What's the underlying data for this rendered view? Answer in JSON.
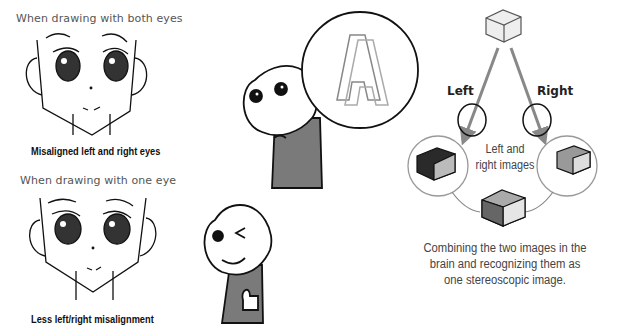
{
  "left_panel": {
    "top_heading": "When drawing with both eyes",
    "top_caption": "Misaligned left and right eyes",
    "bottom_heading": "When drawing with one eye",
    "bottom_caption": "Less left/right misalignment"
  },
  "middle_panel": {
    "speech_bubble_letter": "A"
  },
  "right_panel": {
    "left_label": "Left",
    "right_label": "Right",
    "center_label_line1": "Left and",
    "center_label_line2": "right images",
    "description_line1": "Combining the two images in the",
    "description_line2": "brain and recognizing them as",
    "description_line3": "one stereoscopic image."
  },
  "colors": {
    "heading_gray": "#555555",
    "caption_black": "#111111",
    "arrow_gray": "#888888",
    "shirt_gray": "#7a7a7a"
  }
}
